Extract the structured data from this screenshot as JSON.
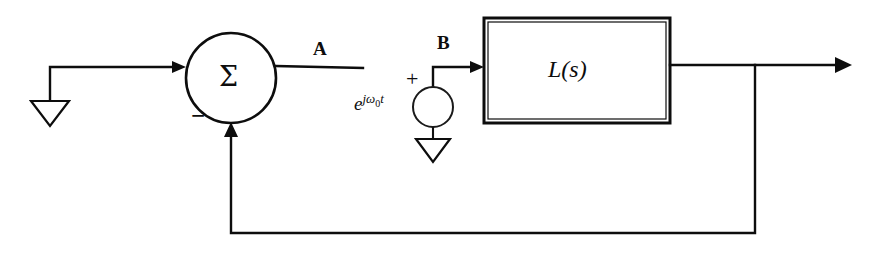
{
  "diagram": {
    "type": "control-system-block-diagram",
    "stroke_color": "#0d0d0d",
    "background_color": "#ffffff",
    "summing_junction": {
      "symbol": "Σ",
      "negative_sign": "−",
      "center_x": 231,
      "center_y": 78,
      "radius": 45
    },
    "signal_labels": {
      "node_a": "A",
      "node_b": "B"
    },
    "source": {
      "expression_base": "e",
      "expression_exponent_j": "j",
      "expression_exponent_omega": "ω",
      "expression_exponent_sub": "0",
      "expression_exponent_t": "t",
      "polarity": "+",
      "center_x": 433,
      "center_y": 107,
      "radius": 20
    },
    "transfer_block": {
      "label_l": "L",
      "label_paren_open": "(",
      "label_s": "s",
      "label_paren_close": ")",
      "x": 484,
      "y": 18,
      "width": 186,
      "height": 105
    },
    "ground_symbols": [
      {
        "name": "input-ground",
        "x": 50,
        "y": 100
      },
      {
        "name": "source-ground",
        "x": 433,
        "y": 137
      }
    ],
    "feedback_path": {
      "tap_x": 755,
      "bottom_y": 233,
      "return_x": 231
    },
    "output": {
      "arrow_tip_x": 852,
      "y": 65
    }
  }
}
